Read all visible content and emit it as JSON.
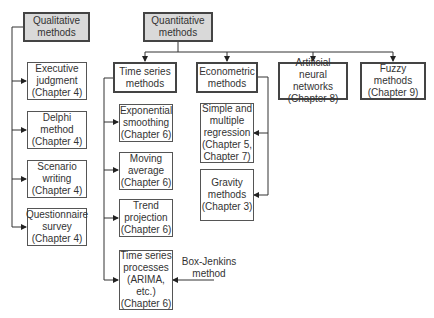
{
  "diagram": {
    "roots": {
      "qualitative": "Qualitative\nmethods",
      "quantitative": "Quantitative\nmethods"
    },
    "qualitative_children": [
      "Executive\njudgment\n(Chapter 4)",
      "Delphi\nmethod\n(Chapter 4)",
      "Scenario\nwriting\n(Chapter 4)",
      "Questionnaire\nsurvey\n(Chapter 4)"
    ],
    "quantitative_children": {
      "time_series": "Time series\nmethods",
      "econometric": "Econometric\nmethods",
      "ann": "Artificial\nneural networks\n(Chapter 8)",
      "fuzzy": "Fuzzy\nmethods\n(Chapter 9)"
    },
    "time_series_children": [
      "Exponential\nsmoothing\n(Chapter 6)",
      "Moving\naverage\n(Chapter 6)",
      "Trend\nprojection\n(Chapter 6)",
      "Time series\nprocesses\n(ARIMA, etc.)\n(Chapter 6)"
    ],
    "econometric_children": [
      "Simple and\nmultiple\nregression\n(Chapter 5,\nChapter 7)",
      "Gravity\nmethods\n(Chapter 3)"
    ],
    "annotation": "Box-Jenkins\nmethod"
  }
}
